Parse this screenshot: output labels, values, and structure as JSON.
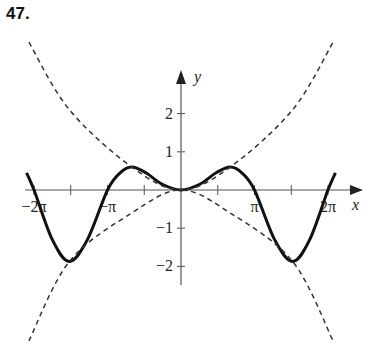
{
  "problem_number": "47.",
  "chart_data": {
    "type": "line",
    "title": "",
    "xlabel": "x",
    "ylabel": "y",
    "xlim": [
      -6.9,
      7.0
    ],
    "ylim": [
      -4.0,
      3.9
    ],
    "x_ticks": [
      {
        "value": -6.2832,
        "label": "−2π"
      },
      {
        "value": -4.7124,
        "label": ""
      },
      {
        "value": -3.1416,
        "label": "−π"
      },
      {
        "value": -1.5708,
        "label": ""
      },
      {
        "value": 1.5708,
        "label": ""
      },
      {
        "value": 3.1416,
        "label": "π"
      },
      {
        "value": 4.7124,
        "label": ""
      },
      {
        "value": 6.2832,
        "label": "2π"
      }
    ],
    "y_ticks": [
      {
        "value": 2,
        "label": "2"
      },
      {
        "value": 1,
        "label": "1"
      },
      {
        "value": -1,
        "label": "−1"
      },
      {
        "value": -2,
        "label": "−2"
      }
    ],
    "grid": false,
    "series": [
      {
        "name": "f(x)",
        "style": "solid",
        "color": "#111111",
        "points": [
          [
            -6.6,
            0.45
          ],
          [
            -6.28,
            0
          ],
          [
            -5.5,
            -1.3
          ],
          [
            -4.77,
            -1.87
          ],
          [
            -4.0,
            -1.3
          ],
          [
            -3.14,
            0
          ],
          [
            -2.6,
            0.45
          ],
          [
            -2.1,
            0.6
          ],
          [
            -1.5,
            0.45
          ],
          [
            -0.8,
            0.15
          ],
          [
            0,
            0
          ],
          [
            0.8,
            0.15
          ],
          [
            1.5,
            0.45
          ],
          [
            2.1,
            0.6
          ],
          [
            2.6,
            0.45
          ],
          [
            3.14,
            0
          ],
          [
            4.0,
            -1.3
          ],
          [
            4.77,
            -1.87
          ],
          [
            5.5,
            -1.3
          ],
          [
            6.28,
            0
          ],
          [
            6.6,
            0.45
          ]
        ]
      },
      {
        "name": "upper envelope",
        "style": "dashed",
        "color": "#333333",
        "points": [
          [
            -6.5,
            3.87
          ],
          [
            -4.77,
            2.1
          ],
          [
            -2.1,
            0.6
          ],
          [
            0,
            0
          ],
          [
            2.1,
            0.6
          ],
          [
            4.77,
            2.1
          ],
          [
            6.5,
            3.87
          ]
        ]
      },
      {
        "name": "lower envelope",
        "style": "dashed",
        "color": "#333333",
        "points": [
          [
            -6.5,
            -3.95
          ],
          [
            -4.77,
            -1.87
          ],
          [
            -2.1,
            -0.6
          ],
          [
            0,
            0
          ],
          [
            2.1,
            -0.6
          ],
          [
            4.77,
            -1.87
          ],
          [
            6.5,
            -3.95
          ]
        ]
      }
    ]
  }
}
